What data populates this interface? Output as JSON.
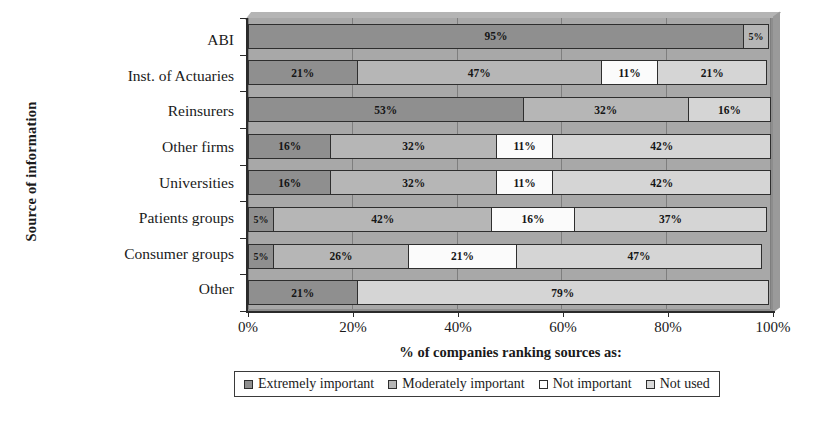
{
  "chart_data": {
    "type": "bar",
    "orientation": "horizontal",
    "stacked": true,
    "title": "",
    "xlabel": "% of companies ranking sources as:",
    "ylabel": "Source of information",
    "xlim": [
      0,
      100
    ],
    "xticks": [
      "0%",
      "20%",
      "40%",
      "60%",
      "80%",
      "100%"
    ],
    "xtick_values": [
      0,
      20,
      40,
      60,
      80,
      100
    ],
    "grid": true,
    "legend_position": "bottom",
    "categories": [
      "ABI",
      "Inst. of Actuaries",
      "Reinsurers",
      "Other firms",
      "Universities",
      "Patients groups",
      "Consumer groups",
      "Other"
    ],
    "series": [
      {
        "name": "Extremely important",
        "color": "#8f8f8f",
        "values": [
          95,
          21,
          53,
          16,
          16,
          5,
          5,
          21
        ]
      },
      {
        "name": "Moderately important",
        "color": "#b6b6b6",
        "values": [
          5,
          47,
          32,
          32,
          32,
          42,
          26,
          0
        ]
      },
      {
        "name": "Not important",
        "color": "#ffffff",
        "values": [
          0,
          11,
          0,
          11,
          11,
          16,
          21,
          0
        ]
      },
      {
        "name": "Not used",
        "color": "#d9d9d9",
        "values": [
          0,
          21,
          16,
          42,
          42,
          37,
          47,
          79
        ]
      }
    ],
    "bar_labels": [
      [
        "95%",
        "5%",
        "",
        ""
      ],
      [
        "21%",
        "47%",
        "11%",
        "21%"
      ],
      [
        "53%",
        "32%",
        "",
        "16%"
      ],
      [
        "16%",
        "32%",
        "11%",
        "42%"
      ],
      [
        "16%",
        "32%",
        "11%",
        "42%"
      ],
      [
        "5%",
        "42%",
        "16%",
        "37%"
      ],
      [
        "5%",
        "26%",
        "21%",
        "47%"
      ],
      [
        "21%",
        "",
        "",
        "79%"
      ]
    ]
  },
  "legend": {
    "items": [
      "Extremely important",
      "Moderately important",
      "Not important",
      "Not used"
    ]
  }
}
